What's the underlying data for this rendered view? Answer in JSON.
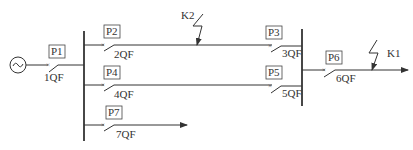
{
  "diagram": {
    "type": "single-line power system diagram",
    "source": {
      "label": "",
      "icon": "ac-generator-icon"
    },
    "buses": [
      {
        "name": "left-bus"
      },
      {
        "name": "right-bus"
      }
    ],
    "protections": [
      {
        "id": "P1",
        "breaker": "1QF"
      },
      {
        "id": "P2",
        "breaker": "2QF"
      },
      {
        "id": "P3",
        "breaker": "3QF"
      },
      {
        "id": "P4",
        "breaker": "4QF"
      },
      {
        "id": "P5",
        "breaker": "5QF"
      },
      {
        "id": "P6",
        "breaker": "6QF"
      },
      {
        "id": "P7",
        "breaker": "7QF"
      }
    ],
    "faults": [
      {
        "id": "K2",
        "location": "line between 2QF and 3QF"
      },
      {
        "id": "K1",
        "location": "outgoing line after 6QF"
      }
    ]
  }
}
